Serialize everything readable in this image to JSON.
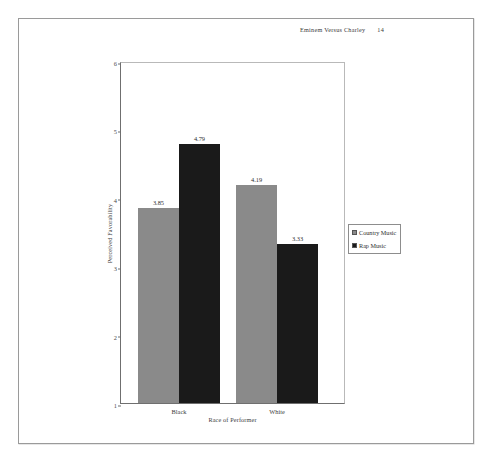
{
  "header": {
    "running_title": "Eminem Versus Charley",
    "page_number": "14"
  },
  "chart_data": {
    "type": "bar",
    "title": "",
    "xlabel": "Race of Performer",
    "ylabel": "Perceived Favorability",
    "categories": [
      "Black",
      "White"
    ],
    "series": [
      {
        "name": "Country Music",
        "values": [
          3.85,
          4.19
        ],
        "color": "#8a8a8a"
      },
      {
        "name": "Rap Music",
        "values": [
          4.79,
          3.33
        ],
        "color": "#1a1a1a"
      }
    ],
    "value_labels": [
      [
        "3.85",
        "4.19"
      ],
      [
        "4.79",
        "3.33"
      ]
    ],
    "ylim": [
      1,
      6
    ],
    "yticks": [
      "1",
      "2",
      "3",
      "4",
      "5",
      "6"
    ],
    "grid": false,
    "legend_position": "right"
  },
  "legend": {
    "entries": [
      {
        "label": "Country Music",
        "color": "#8a8a8a"
      },
      {
        "label": "Rap Music",
        "color": "#1a1a1a"
      }
    ]
  },
  "caption": {
    "text": ""
  }
}
